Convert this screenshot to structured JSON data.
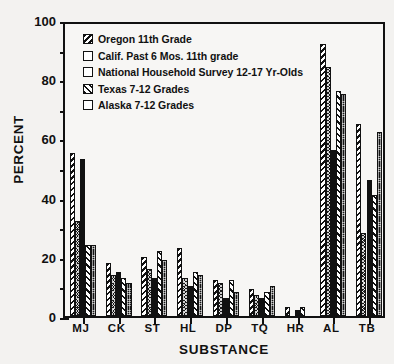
{
  "chart_data": {
    "type": "bar",
    "title": "",
    "xlabel": "SUBSTANCE",
    "ylabel": "PERCENT",
    "ylim": [
      0,
      100
    ],
    "ytick_labels": [
      "0",
      "20",
      "40",
      "60",
      "80",
      "100"
    ],
    "ytick_values": [
      0,
      20,
      40,
      60,
      80,
      100
    ],
    "yminor_values": [
      10,
      30,
      50,
      70,
      90
    ],
    "grid": false,
    "legend_position": "upper-left-inside",
    "categories": [
      "MJ",
      "CK",
      "ST",
      "HL",
      "DP",
      "TQ",
      "HR",
      "AL",
      "TB"
    ],
    "series": [
      {
        "name": "Oregon 11th Grade",
        "pattern": "backslash-hatch",
        "values": [
          55,
          18,
          20,
          23,
          12,
          9,
          3,
          92,
          65
        ]
      },
      {
        "name": "Calif. Past 6 Mos. 11th grade",
        "pattern": "dark-crosshatch",
        "values": [
          32,
          14,
          16,
          13,
          11,
          7,
          0,
          84,
          28
        ]
      },
      {
        "name": "National Household Survey 12-17 Yr-Olds",
        "pattern": "solid-black",
        "values": [
          53,
          15,
          13,
          10,
          6,
          6,
          2,
          56,
          46
        ]
      },
      {
        "name": "Texas 7-12 Grades",
        "pattern": "forwardslash-hatch",
        "values": [
          24,
          13,
          22,
          15,
          12,
          8,
          3,
          76,
          41
        ]
      },
      {
        "name": "Alaska 7-12 Grades",
        "pattern": "dark-stipple",
        "values": [
          24,
          11,
          19,
          14,
          8,
          10,
          0,
          75,
          62
        ]
      }
    ]
  }
}
